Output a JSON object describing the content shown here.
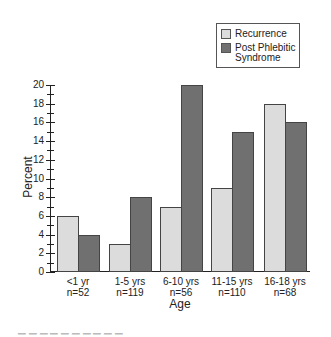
{
  "chart_data": {
    "type": "bar",
    "title": "",
    "xlabel": "Age",
    "ylabel": "Percent",
    "ylim": [
      0,
      20
    ],
    "yticks": [
      0,
      2,
      4,
      6,
      8,
      10,
      12,
      14,
      16,
      18,
      20
    ],
    "grid": false,
    "legend_position": "top-right",
    "categories": [
      "<1 yr",
      "1-5 yrs",
      "6-10 yrs",
      "11-15 yrs",
      "16-18 yrs"
    ],
    "category_n": [
      "n=52",
      "n=119",
      "n=56",
      "n=110",
      "n=68"
    ],
    "series": [
      {
        "name": "Recurrence",
        "color": "#dcdcdc",
        "values": [
          6,
          3,
          7,
          9,
          18
        ]
      },
      {
        "name": "Post Phlebitic Syndrome",
        "color": "#707070",
        "values": [
          4,
          8,
          20,
          15,
          16
        ]
      }
    ]
  },
  "legend": {
    "item1": "Recurrence",
    "item2_line1": "Post Phlebitic",
    "item2_line2": "Syndrome"
  },
  "axes": {
    "x_title": "Age",
    "y_title": "Percent",
    "y_labels": [
      "0",
      "2",
      "4",
      "6",
      "8",
      "10",
      "12",
      "14",
      "16",
      "18",
      "20"
    ],
    "x_labels": [
      {
        "age": "<1 yr",
        "n": "n=52"
      },
      {
        "age": "1-5 yrs",
        "n": "n=119"
      },
      {
        "age": "6-10 yrs",
        "n": "n=56"
      },
      {
        "age": "11-15 yrs",
        "n": "n=110"
      },
      {
        "age": "16-18 yrs",
        "n": "n=68"
      }
    ]
  }
}
